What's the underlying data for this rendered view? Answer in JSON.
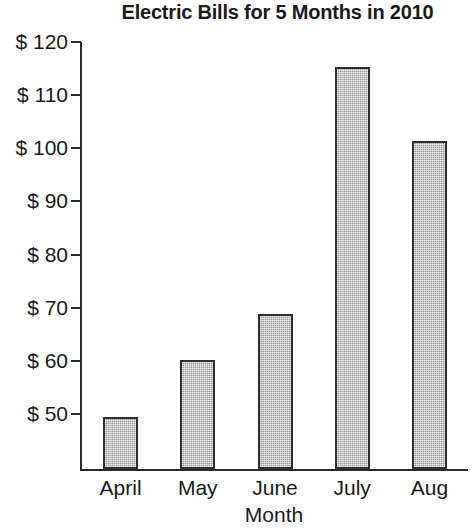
{
  "chart_data": {
    "type": "bar",
    "title": "Electric Bills for 5 Months in 2010",
    "xlabel": "Month",
    "ylabel": "",
    "categories": [
      "April",
      "May",
      "June",
      "July",
      "Aug"
    ],
    "values": [
      49.5,
      60.2,
      68.8,
      115.3,
      101.3
    ],
    "ytick_labels": [
      "$ 120",
      "$ 110",
      "$ 100",
      "$ 90",
      "$ 80",
      "$ 70",
      "$ 60",
      "$ 50"
    ],
    "ytick_values": [
      120,
      110,
      100,
      90,
      80,
      70,
      60,
      50
    ],
    "ylim": [
      42,
      120
    ],
    "axis_bottom_value": 42,
    "currency_symbol": "$",
    "grid": false,
    "legend": false,
    "bar_fill_color": "#9a9a9a",
    "bar_border_color": "#2e2e2e",
    "axis_color": "#2b2b2b",
    "background_color": "#ffffff"
  }
}
